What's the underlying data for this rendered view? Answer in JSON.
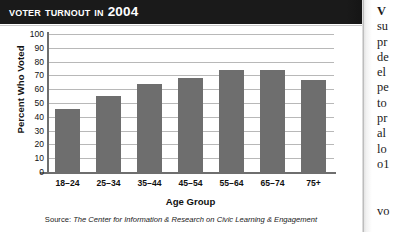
{
  "figure": {
    "title": "Voter Turnout in 2004",
    "source_label": "Source:",
    "source_text": "The Center for Information & Research on Civic Learning & Engagement"
  },
  "chart_data": {
    "type": "bar",
    "title": "Voter Turnout in 2004",
    "xlabel": "Age Group",
    "ylabel": "Percent Who Voted",
    "categories": [
      "18–24",
      "25–34",
      "35–44",
      "45–54",
      "55–64",
      "65–74",
      "75+"
    ],
    "values": [
      46,
      55,
      64,
      68,
      74,
      74,
      67
    ],
    "ylim": [
      0,
      100
    ],
    "yticks": [
      0,
      10,
      20,
      30,
      40,
      50,
      60,
      70,
      80,
      90,
      100
    ],
    "ytick_labels": [
      "0",
      "10",
      "20",
      "30",
      "40",
      "50",
      "60",
      "70",
      "80",
      "90",
      "100"
    ],
    "grid": true,
    "legend": false,
    "bar_color": "#6e6e6e",
    "axis_color": "#6e6e6e",
    "grid_color": "#b8b8b8"
  },
  "body_text": {
    "paragraph_1_lines": [
      "V",
      "su",
      "pr",
      "de",
      "el",
      "pe",
      "to",
      "pr",
      "al",
      "lo",
      "o1"
    ],
    "paragraph_2_lines": [
      "vo"
    ]
  }
}
